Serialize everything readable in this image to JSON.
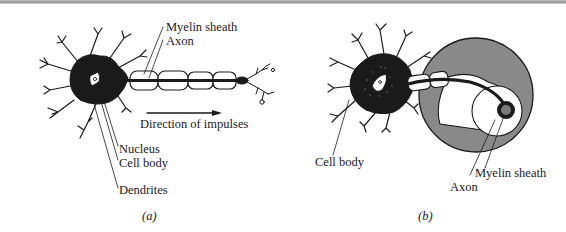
{
  "figure": {
    "panel_a": {
      "caption": "(a)",
      "labels": {
        "myelin_sheath": "Myelin sheath",
        "axon": "Axon",
        "direction": "Direction of impulses",
        "nucleus": "Nucleus",
        "cell_body": "Cell body",
        "dendrites": "Dendrites"
      }
    },
    "panel_b": {
      "caption": "(b)",
      "labels": {
        "cell_body": "Cell body",
        "myelin_sheath": "Myelin sheath",
        "axon": "Axon"
      }
    },
    "colors": {
      "ink": "#1a1a1a",
      "cross_section_fill": "#8a8a8a",
      "axon_core_fill": "#7a7a7a"
    }
  }
}
